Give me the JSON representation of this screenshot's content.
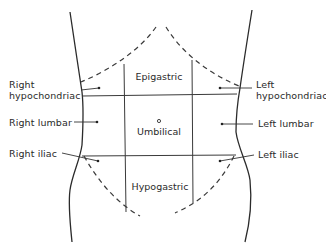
{
  "diagram": {
    "regions": {
      "epigastric": "Epigastric",
      "umbilical": "Umbilical",
      "hypogastric": "Hypogastric"
    },
    "labels": {
      "right_hypochondriac_line1": "Right",
      "right_hypochondriac_line2": "hypochondriac",
      "left_hypochondriac_line1": "Left",
      "left_hypochondriac_line2": "hypochondriac",
      "right_lumbar": "Right lumbar",
      "left_lumbar": "Left lumbar",
      "right_iliac": "Right iliac",
      "left_iliac": "Left iliac"
    },
    "colors": {
      "line": "#2b2b2b",
      "text": "#2a2a2a",
      "background": "#ffffff"
    }
  }
}
